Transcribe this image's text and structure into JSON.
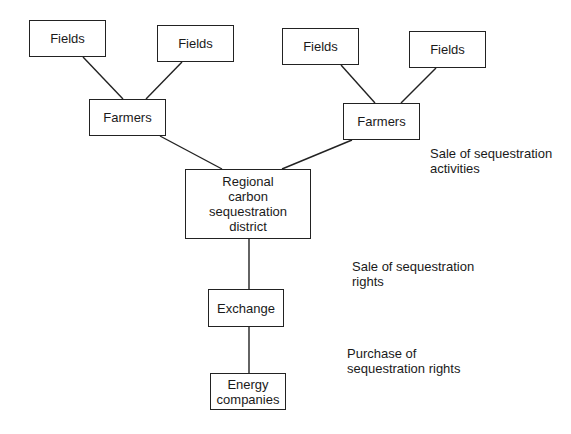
{
  "diagram": {
    "nodes": {
      "fields_1": "Fields",
      "fields_2": "Fields",
      "fields_3": "Fields",
      "fields_4": "Fields",
      "farmers_left": "Farmers",
      "farmers_right": "Farmers",
      "district": "Regional carbon sequestration district",
      "exchange": "Exchange",
      "energy": "Energy companies"
    },
    "annotations": {
      "sale_activities": "Sale of sequestration activities",
      "sale_rights": "Sale of sequestration rights",
      "purchase_rights": "Purchase of sequestration rights"
    },
    "colors": {
      "line": "#222222",
      "background": "#ffffff",
      "text": "#1a1a1a"
    }
  }
}
